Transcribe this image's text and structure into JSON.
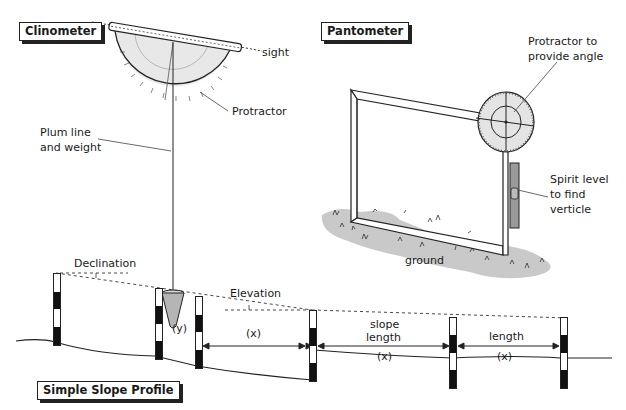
{
  "titles": {
    "clinometer": "Clinometer",
    "pantometer": "Pantometer",
    "slope_profile": "Simple Slope Profile"
  },
  "clinometer_labels": {
    "sight": "sight",
    "protractor": "Protractor",
    "plum_line_1": "Plum line",
    "plum_line_2": "and weight"
  },
  "pantometer_labels": {
    "protractor_1": "Protractor to",
    "protractor_2": "provide angle",
    "spirit_1": "Spirit level",
    "spirit_2": "to find",
    "spirit_3": "verticle",
    "ground": "ground"
  },
  "profile_labels": {
    "declination": "Declination",
    "elevation": "Elevation",
    "y": "(y)",
    "x1": "(x)",
    "slope_1": "slope",
    "slope_2": "length",
    "x2": "(x)",
    "length": "length",
    "x3": "(x)"
  },
  "colors": {
    "ink": "#1a1a1a",
    "fill_light": "#e6e6e6",
    "grass": "#c8c8c8",
    "level": "#9a9a9a"
  }
}
